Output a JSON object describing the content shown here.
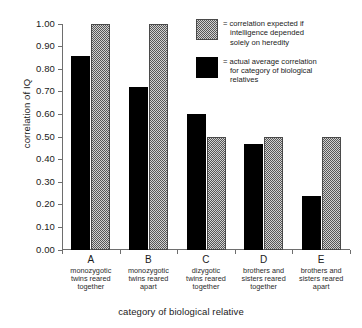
{
  "chart_data": {
    "type": "bar",
    "title": "",
    "xlabel": "category of biological relative",
    "ylabel": "correlation of IQ",
    "ylim": [
      0.0,
      1.0
    ],
    "ytick_labels": [
      "0.00",
      "0.10",
      "0.20",
      "0.30",
      "0.40",
      "0.50",
      "0.60",
      "0.70",
      "0.80",
      "0.90",
      "1.00"
    ],
    "ytick_values": [
      0.0,
      0.1,
      0.2,
      0.3,
      0.4,
      0.5,
      0.6,
      0.7,
      0.8,
      0.9,
      1.0
    ],
    "grid": false,
    "legend_position": "top-right",
    "categories": [
      "A",
      "B",
      "C",
      "D",
      "E"
    ],
    "category_descriptions": [
      "monozygotic twins reared together",
      "monozygotic twins reared apart",
      "dizygotic twins reared together",
      "brothers and sisters reared together",
      "brothers and sisters reared apart"
    ],
    "category_description_lines": [
      [
        "monozygotic",
        "twins reared",
        "together"
      ],
      [
        "monozygotic",
        "twins reared",
        "apart"
      ],
      [
        "dizygotic",
        "twins reared",
        "together"
      ],
      [
        "brothers and",
        "sisters reared",
        "together"
      ],
      [
        "brothers and",
        "sisters reared",
        "apart"
      ]
    ],
    "series": [
      {
        "name": "actual average correlation for category of biological relatives",
        "style": "solid-black",
        "color": "#000000",
        "values": [
          0.86,
          0.72,
          0.6,
          0.47,
          0.24
        ]
      },
      {
        "name": "correlation expected if intelligence depended solely on heredity",
        "style": "stippled-gray",
        "color": "#d2d2d2",
        "values": [
          1.0,
          1.0,
          0.5,
          0.5,
          0.5
        ]
      }
    ]
  },
  "legend": {
    "items": [
      {
        "swatch": "stipple",
        "equals": "=",
        "lines": [
          "correlation expected if",
          "intelligence depended",
          "solely on heredity"
        ]
      },
      {
        "swatch": "solid",
        "equals": "=",
        "lines": [
          "actual average correlation",
          "for category of biological",
          "relatives"
        ]
      }
    ]
  }
}
